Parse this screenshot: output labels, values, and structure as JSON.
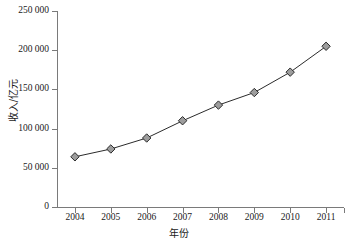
{
  "chart_data": {
    "type": "line",
    "title": "",
    "xlabel": "年份",
    "ylabel": "收入/亿元",
    "categories": [
      "2004",
      "2005",
      "2006",
      "2007",
      "2008",
      "2009",
      "2010",
      "2011"
    ],
    "x": [
      2004,
      2005,
      2006,
      2007,
      2008,
      2009,
      2010,
      2011
    ],
    "values": [
      64000,
      74000,
      88000,
      110000,
      130000,
      146000,
      172000,
      205000
    ],
    "series": [
      {
        "name": "收入",
        "values": [
          64000,
          74000,
          88000,
          110000,
          130000,
          146000,
          172000,
          205000
        ]
      }
    ],
    "ylim": [
      0,
      250000
    ],
    "xlim": [
      2003.5,
      2011.5
    ],
    "ytick_values": [
      0,
      50000,
      100000,
      150000,
      200000,
      250000
    ],
    "ytick_labels": [
      "0",
      "50 000",
      "100 000",
      "150 000",
      "200 000",
      "250 000"
    ],
    "xtick_labels": [
      "2004",
      "2005",
      "2006",
      "2007",
      "2008",
      "2009",
      "2010",
      "2011"
    ],
    "grid": false,
    "legend": false,
    "legend_position": "none",
    "marker": "diamond",
    "marker_fill": "#9d9d9d",
    "marker_edge": "#2b2b2b",
    "line_color": "#2b2b2b",
    "axis_color": "#7a7a7a",
    "background": "#ffffff"
  }
}
